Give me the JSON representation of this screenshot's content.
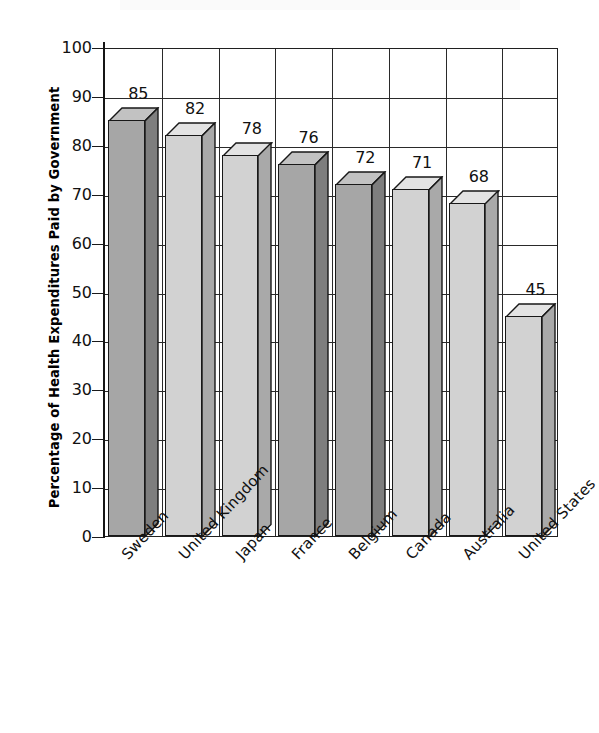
{
  "chart_data": {
    "type": "bar",
    "title": "",
    "xlabel": "",
    "ylabel": "Percentage of Health Expenditures Paid by Government",
    "ylim": [
      0,
      100
    ],
    "ytick_step": 10,
    "yticks": [
      100,
      90,
      80,
      70,
      60,
      50,
      40,
      30,
      20,
      10,
      0
    ],
    "grid": true,
    "legend": "none",
    "style": "3d-column",
    "categories": [
      "Sweden",
      "United Kingdom",
      "Japan",
      "France",
      "Belgium",
      "Canada",
      "Australia",
      "United States"
    ],
    "values": [
      85,
      82,
      78,
      76,
      72,
      71,
      68,
      45
    ],
    "value_labels": [
      "85",
      "82",
      "78",
      "76",
      "72",
      "71",
      "68",
      "45"
    ],
    "bar_shades": [
      "dark",
      "light",
      "light",
      "dark",
      "dark",
      "light",
      "light",
      "light"
    ],
    "colors": {
      "bar_dark_front": "#a6a6a6",
      "bar_dark_top": "#c2c2c2",
      "bar_dark_side": "#7e7e7e",
      "bar_light_front": "#d2d2d2",
      "bar_light_top": "#e3e3e3",
      "bar_light_side": "#a9a9a9",
      "axis": "#202020",
      "grid": "#2a2a2a",
      "text": "#111111",
      "background": "#ffffff"
    }
  }
}
